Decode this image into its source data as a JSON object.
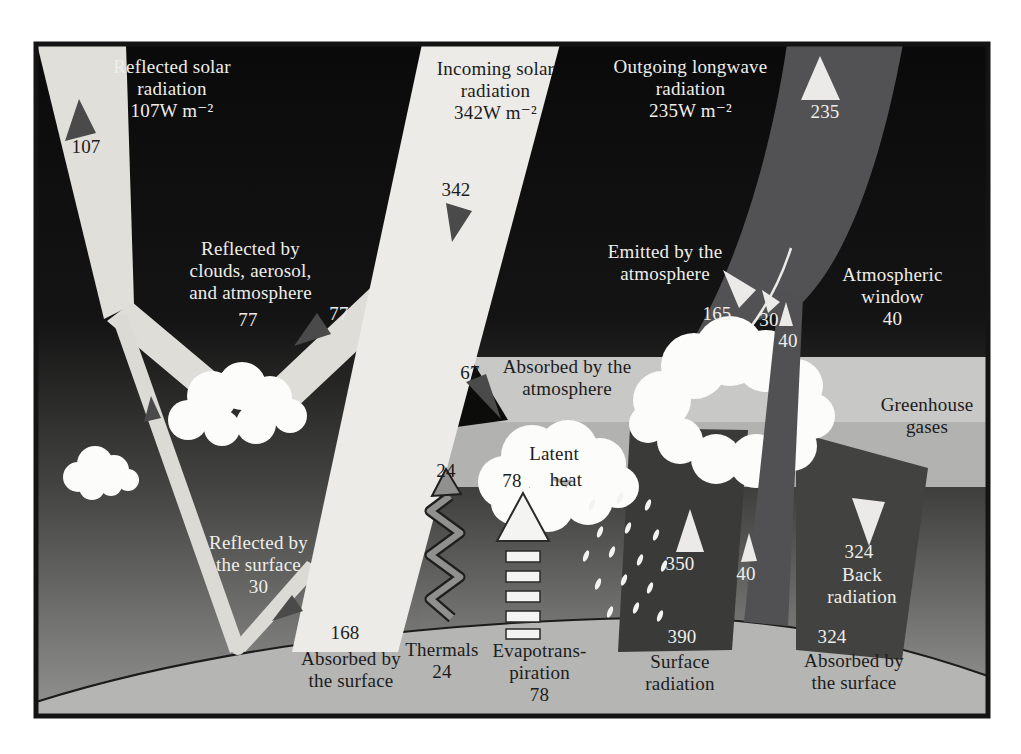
{
  "figure": {
    "name": "Earth energy budget diagram",
    "units": "W m⁻²"
  },
  "labels": {
    "reflected_solar": {
      "lines": [
        "Reflected solar",
        "radiation",
        "107W m⁻²"
      ],
      "value": "107"
    },
    "incoming_solar": {
      "lines": [
        "Incoming solar",
        "radiation",
        "342W m⁻²"
      ],
      "value": "342"
    },
    "outgoing_longwave": {
      "lines": [
        "Outgoing longwave",
        "radiation",
        "235W m⁻²"
      ],
      "value": "235"
    },
    "reflected_clouds": {
      "lines": [
        "Reflected by",
        "clouds, aerosol,",
        "and atmosphere"
      ],
      "value_a": "77",
      "value_b": "77"
    },
    "absorbed_atmosphere": {
      "value": "67",
      "lines": [
        "Absorbed by the",
        "atmosphere"
      ]
    },
    "emitted_atmosphere": {
      "lines": [
        "Emitted by the",
        "atmosphere"
      ],
      "value_165": "165",
      "value_30": "30",
      "value_40": "40"
    },
    "atmospheric_window": {
      "lines": [
        "Atmospheric",
        "window",
        "40"
      ]
    },
    "greenhouse": {
      "lines": [
        "Greenhouse",
        "gases"
      ]
    },
    "latent_heat": {
      "value_24": "24",
      "word_latent": "Latent",
      "value_78": "78",
      "word_heat": "heat"
    },
    "reflected_surface": {
      "lines": [
        "Reflected by",
        "the surface",
        "30"
      ]
    },
    "absorbed_surface_left": {
      "value": "168",
      "lines": [
        "Absorbed by",
        "the surface"
      ]
    },
    "thermals": {
      "lines": [
        "Thermals",
        "24"
      ]
    },
    "evapotranspiration": {
      "lines": [
        "Evapotrans-",
        "piration",
        "78"
      ]
    },
    "surface_radiation": {
      "value_350": "350",
      "value_40": "40",
      "value_390": "390",
      "lines": [
        "Surface",
        "radiation"
      ]
    },
    "back_radiation": {
      "value_top": "324",
      "lines": [
        "Back",
        "radiation"
      ],
      "value_bottom": "324",
      "absorbed_lines": [
        "Absorbed by",
        "the surface"
      ]
    }
  },
  "fluxes": {
    "incoming_solar": 342,
    "reflected_solar_total": 107,
    "reflected_by_clouds_aerosol_atmosphere": 77,
    "reflected_by_surface": 30,
    "absorbed_by_atmosphere": 67,
    "absorbed_by_surface_solar": 168,
    "outgoing_longwave_total": 235,
    "emitted_by_atmosphere": 165,
    "emitted_by_clouds": 30,
    "atmospheric_window": 40,
    "surface_radiation": 390,
    "surface_radiation_absorbed_by_greenhouse": 350,
    "back_radiation": 324,
    "back_radiation_absorbed_by_surface": 324,
    "thermals": 24,
    "evapotranspiration": 78,
    "latent_heat": 78
  },
  "colors": {
    "space_black": "#0c0c0b",
    "solar_beam": "#edebe7",
    "reflected_beam": "#dfddd8",
    "longwave_beam": "#525254",
    "band_light": "#c8c8c6",
    "band_medium": "#b2b2b0",
    "lower_dark": "#454543",
    "surface": "#b5b5b3",
    "cloud": "#fcfcfa",
    "dark_arrow": "#4a4a4a",
    "white_arrow": "#eceae8",
    "dark_radiation_band": "#3a3a38",
    "back_radiation_band": "#424240"
  }
}
